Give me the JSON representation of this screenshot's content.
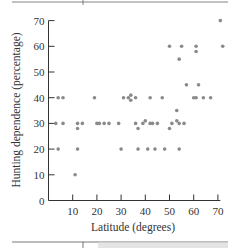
{
  "chart_data": {
    "type": "scatter",
    "title": "",
    "xlabel": "Latitude (degrees)",
    "ylabel": "Hunting dependence (percentage)",
    "xlim": [
      0,
      72
    ],
    "ylim": [
      0,
      70
    ],
    "xticks": [
      10,
      20,
      30,
      40,
      50,
      60,
      70
    ],
    "yticks": [
      0,
      10,
      20,
      30,
      40,
      50,
      60,
      70
    ],
    "grid": false,
    "legend": null,
    "series": [
      {
        "name": "Societies",
        "points": [
          [
            71,
            70
          ],
          [
            50,
            60
          ],
          [
            55,
            60
          ],
          [
            61,
            58
          ],
          [
            61,
            60
          ],
          [
            72,
            60
          ],
          [
            54,
            55
          ],
          [
            57,
            45
          ],
          [
            62,
            45
          ],
          [
            4,
            40
          ],
          [
            6,
            40
          ],
          [
            19,
            40
          ],
          [
            31,
            40
          ],
          [
            33,
            40
          ],
          [
            34,
            41
          ],
          [
            34,
            39
          ],
          [
            36,
            40
          ],
          [
            42,
            40
          ],
          [
            47,
            40
          ],
          [
            60,
            40
          ],
          [
            61,
            40
          ],
          [
            64,
            40
          ],
          [
            67,
            40
          ],
          [
            53,
            35
          ],
          [
            3,
            30
          ],
          [
            6,
            30
          ],
          [
            12,
            28
          ],
          [
            12,
            30
          ],
          [
            14,
            30
          ],
          [
            20,
            30
          ],
          [
            21,
            30
          ],
          [
            23,
            30
          ],
          [
            25,
            30
          ],
          [
            29,
            30
          ],
          [
            36,
            30
          ],
          [
            37,
            28
          ],
          [
            39,
            30
          ],
          [
            40,
            31
          ],
          [
            42,
            30
          ],
          [
            43,
            30
          ],
          [
            45,
            30
          ],
          [
            50,
            28
          ],
          [
            51,
            30
          ],
          [
            53,
            31
          ],
          [
            54,
            30
          ],
          [
            56,
            30
          ],
          [
            4,
            20
          ],
          [
            12,
            20
          ],
          [
            30,
            20
          ],
          [
            37,
            20
          ],
          [
            41,
            20
          ],
          [
            44,
            20
          ],
          [
            48,
            20
          ],
          [
            54,
            20
          ],
          [
            11,
            10
          ]
        ]
      }
    ]
  },
  "colors": {
    "dot": "#8a8a8a",
    "axis": "#333333",
    "band": "#e4e4e4"
  }
}
